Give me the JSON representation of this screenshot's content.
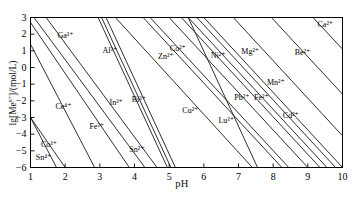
{
  "chart_data": {
    "type": "line",
    "title": "",
    "xlabel": "pH",
    "ylabel": "lg[Me^n+]/(mol/L)",
    "xlim": [
      1,
      10
    ],
    "ylim": [
      -6,
      3
    ],
    "xticks": [
      1,
      2,
      3,
      4,
      5,
      6,
      7,
      8,
      9,
      10
    ],
    "yticks": [
      3,
      2,
      1,
      0,
      -1,
      -2,
      -3,
      -4,
      -5,
      -6
    ],
    "grid": false,
    "legend": "none",
    "line_color": "#1a1a1a",
    "frame_color": "#000000",
    "series": [
      {
        "name": "Sn4+",
        "label": "Sn⁴⁺",
        "ion": "Sn",
        "charge": 4,
        "x": [
          1.0,
          1.75
        ],
        "y": [
          -3.0,
          -6.0
        ],
        "label_xy": [
          1.15,
          -5.45
        ]
      },
      {
        "name": "Co3+",
        "label": "Co³⁺",
        "ion": "Co",
        "charge": 3,
        "x": [
          1.0,
          2.0
        ],
        "y": [
          -3.0,
          -6.0
        ],
        "label_xy": [
          1.3,
          -4.62
        ]
      },
      {
        "name": "Ce4+",
        "label": "Ce⁴⁺",
        "ion": "Ce",
        "charge": 4,
        "x": [
          1.0,
          2.85
        ],
        "y": [
          1.4,
          -6.0
        ],
        "label_xy": [
          1.72,
          -2.38
        ]
      },
      {
        "name": "Fe3+",
        "label": "Fe³⁺",
        "ion": "Fe",
        "charge": 3,
        "x": [
          1.0,
          3.85
        ],
        "y": [
          2.7,
          -6.0
        ],
        "label_xy": [
          2.7,
          -3.55
        ]
      },
      {
        "name": "Ga3+",
        "label": "Ga³⁺",
        "ion": "Ga",
        "charge": 3,
        "x": [
          1.1,
          4.3
        ],
        "y": [
          3.0,
          -6.0
        ],
        "label_xy": [
          1.78,
          1.9
        ]
      },
      {
        "name": "Sn2+",
        "label": "Sn²⁺",
        "ion": "Sn",
        "charge": 2,
        "x": [
          1.45,
          4.65
        ],
        "y": [
          3.0,
          -6.0
        ],
        "label_xy": [
          3.85,
          -4.92
        ]
      },
      {
        "name": "Al3+",
        "label": "Al³⁺",
        "ion": "Al",
        "charge": 3,
        "x": [
          2.95,
          4.95
        ],
        "y": [
          3.0,
          -6.0
        ],
        "label_xy": [
          3.08,
          1.02
        ]
      },
      {
        "name": "In3+",
        "label": "In³⁺",
        "ion": "In",
        "charge": 3,
        "x": [
          3.05,
          5.05
        ],
        "y": [
          3.0,
          -6.0
        ],
        "label_xy": [
          3.28,
          -2.12
        ]
      },
      {
        "name": "Bi3+",
        "label": "Bi³⁺",
        "ion": "Bi",
        "charge": 3,
        "x": [
          3.18,
          5.18
        ],
        "y": [
          3.0,
          -6.0
        ],
        "label_xy": [
          3.92,
          -1.92
        ]
      },
      {
        "name": "Cu2+",
        "label": "Cu²⁺",
        "ion": "Cu",
        "charge": 2,
        "x": [
          3.45,
          7.4
        ],
        "y": [
          3.0,
          -6.0
        ],
        "label_xy": [
          5.38,
          -2.62
        ]
      },
      {
        "name": "Zn2+",
        "label": "Zn²⁺",
        "ion": "Zn",
        "charge": 2,
        "x": [
          4.25,
          8.25
        ],
        "y": [
          3.0,
          -6.0
        ],
        "label_xy": [
          4.68,
          0.62
        ]
      },
      {
        "name": "Co2+",
        "label": "Co²⁺",
        "ion": "Co",
        "charge": 2,
        "x": [
          4.45,
          8.45
        ],
        "y": [
          3.0,
          -6.0
        ],
        "label_xy": [
          5.02,
          1.12
        ]
      },
      {
        "name": "Lu3+",
        "label": "Lu³⁺",
        "ion": "Lu",
        "charge": 3,
        "x": [
          5.55,
          7.55
        ],
        "y": [
          3.0,
          -6.0
        ],
        "label_xy": [
          6.42,
          -3.22
        ]
      },
      {
        "name": "Ni2+",
        "label": "Ni²⁺",
        "ion": "Ni",
        "charge": 2,
        "x": [
          5.0,
          9.0
        ],
        "y": [
          3.0,
          -6.0
        ],
        "label_xy": [
          6.2,
          0.72
        ]
      },
      {
        "name": "Pb2+",
        "label": "Pb²⁺",
        "ion": "Pb",
        "charge": 2,
        "x": [
          5.35,
          9.35
        ],
        "y": [
          3.0,
          -6.0
        ],
        "label_xy": [
          6.88,
          -1.82
        ]
      },
      {
        "name": "Fe2+",
        "label": "Fe²⁺",
        "ion": "Fe",
        "charge": 2,
        "x": [
          5.55,
          9.55
        ],
        "y": [
          3.0,
          -6.0
        ],
        "label_xy": [
          7.45,
          -1.82
        ]
      },
      {
        "name": "Cd2+",
        "label": "Cd²⁺",
        "ion": "Cd",
        "charge": 2,
        "x": [
          5.8,
          9.8
        ],
        "y": [
          3.0,
          -6.0
        ],
        "label_xy": [
          8.28,
          -2.88
        ]
      },
      {
        "name": "Mn2+",
        "label": "Mn²⁺",
        "ion": "Mn",
        "charge": 2,
        "x": [
          6.0,
          10.0
        ],
        "y": [
          3.0,
          -6.0
        ],
        "label_xy": [
          7.82,
          -0.92
        ]
      },
      {
        "name": "Mg2+",
        "label": "Mg²⁺",
        "ion": "Mg",
        "charge": 2,
        "x": [
          6.85,
          10.0
        ],
        "y": [
          3.0,
          -4.1
        ],
        "label_xy": [
          7.08,
          0.92
        ]
      },
      {
        "name": "Be2+",
        "label": "Be²⁺",
        "ion": "Be",
        "charge": 2,
        "x": [
          7.95,
          10.0
        ],
        "y": [
          3.0,
          -1.6
        ],
        "label_xy": [
          8.62,
          0.88
        ]
      },
      {
        "name": "Ca2+",
        "label": "Ca²⁺",
        "ion": "Ca",
        "charge": 2,
        "x": [
          9.15,
          10.0
        ],
        "y": [
          3.0,
          1.1
        ],
        "label_xy": [
          9.28,
          2.58
        ]
      }
    ]
  }
}
